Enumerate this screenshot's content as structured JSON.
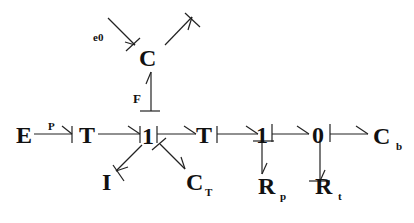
{
  "diagram": {
    "type": "bond-graph",
    "nodes": {
      "E": "E",
      "T1": "T",
      "J1a": "1",
      "T2": "T",
      "J1b": "1",
      "J0": "0",
      "Cb": "C",
      "Cb_sub": "b",
      "C": "C",
      "I": "I",
      "CT": "C",
      "CT_sub": "T",
      "Rp": "R",
      "Rp_sub": "p",
      "Rt": "R",
      "Rt_sub": "t"
    },
    "labels": {
      "p": "P",
      "F": "F",
      "e0": "e0"
    }
  }
}
